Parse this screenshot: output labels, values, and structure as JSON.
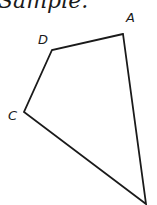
{
  "heading": "Sample.",
  "figure": {
    "type": "quadrilateral",
    "stroke_color": "#1a1a1a",
    "vertices": [
      {
        "label": "A",
        "x": 123,
        "y": 34,
        "label_x": 126,
        "label_y": 22
      },
      {
        "label": "D",
        "x": 52,
        "y": 50,
        "label_x": 38,
        "label_y": 44
      },
      {
        "label": "C",
        "x": 24,
        "y": 112,
        "label_x": 8,
        "label_y": 120
      },
      {
        "label": "",
        "x": 146,
        "y": 204,
        "label_x": 0,
        "label_y": 0
      }
    ]
  }
}
